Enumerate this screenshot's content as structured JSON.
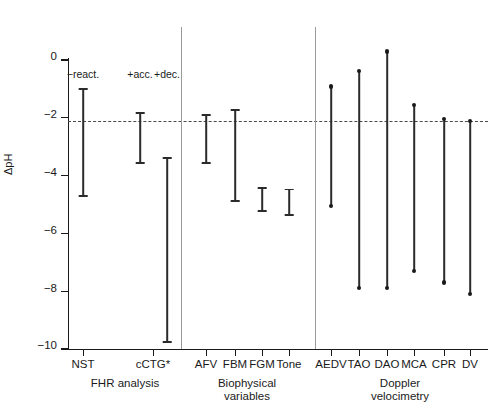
{
  "chart_data": {
    "type": "range",
    "title": "",
    "xlabel": "",
    "ylabel": "ΔpH",
    "ylim": [
      -10,
      0
    ],
    "yticks": [
      0,
      -2,
      -4,
      -6,
      -8,
      -10
    ],
    "ytick_labels": [
      "0",
      "−2",
      "−4",
      "−6",
      "−8",
      "−10"
    ],
    "grid": false,
    "reference_line": {
      "value": -2,
      "style": "dashed"
    },
    "legend": "none",
    "groups": [
      {
        "caption": "FHR analysis",
        "caption_lines": [
          "FHR analysis"
        ],
        "items": [
          {
            "label": "NST",
            "annotation": "−react.",
            "low": -4.75,
            "high": -0.98,
            "marker": "cap"
          },
          {
            "label": "cCTG*",
            "annotation": "+acc.",
            "low": -3.6,
            "high": -1.8,
            "marker": "cap"
          },
          {
            "label": "",
            "annotation": "+dec.",
            "low": -9.8,
            "high": -3.35,
            "marker": "cap"
          }
        ]
      },
      {
        "caption": "Biophysical variables",
        "caption_lines": [
          "Biophysical",
          "variables"
        ],
        "items": [
          {
            "label": "AFV",
            "annotation": "",
            "low": -3.6,
            "high": -1.88,
            "marker": "cap"
          },
          {
            "label": "FBM",
            "annotation": "",
            "low": -4.9,
            "high": -1.7,
            "marker": "cap"
          },
          {
            "label": "FGM",
            "annotation": "",
            "low": -5.25,
            "high": -4.4,
            "marker": "cap"
          },
          {
            "label": "Tone",
            "annotation": "",
            "low": -5.4,
            "high": -4.45,
            "marker": "cap"
          }
        ]
      },
      {
        "caption": "Doppler velocimetry",
        "caption_lines": [
          "Doppler",
          "velocimetry"
        ],
        "items": [
          {
            "label": "AEDV",
            "annotation": "",
            "low": -5.05,
            "high": -0.92,
            "marker": "dot"
          },
          {
            "label": "TAO",
            "annotation": "",
            "low": -7.9,
            "high": -0.38,
            "marker": "dot"
          },
          {
            "label": "DAO",
            "annotation": "",
            "low": -7.9,
            "high": 0.3,
            "marker": "dot"
          },
          {
            "label": "MCA",
            "annotation": "",
            "low": -7.3,
            "high": -1.55,
            "marker": "dot"
          },
          {
            "label": "CPR",
            "annotation": "",
            "low": -7.7,
            "high": -2.05,
            "marker": "dot"
          },
          {
            "label": "DV",
            "annotation": "",
            "low": -8.1,
            "high": -2.12,
            "marker": "dot"
          }
        ]
      }
    ]
  },
  "layout": {
    "x_positions": {
      "NST": 83,
      "cCTG_acc": 140,
      "cCTG_dec": 167,
      "AFV": 206,
      "FBM": 235,
      "FGM": 262,
      "Tone": 289,
      "AEDV": 331,
      "TAO": 359,
      "DAO": 387,
      "MCA": 414,
      "CPR": 444,
      "DV": 470
    },
    "tick_positions": [
      83,
      153,
      206,
      235,
      262,
      289,
      331,
      359,
      387,
      414,
      444,
      470
    ],
    "separators": [
      181,
      315
    ],
    "group_caption_x": [
      125,
      247,
      400
    ],
    "annotation_y": 68
  },
  "colors": {
    "axis": "#1a1a1a",
    "bar": "#2b2b2b",
    "reference": "#4a4a4a",
    "separator": "#9a9a9a",
    "background": "#ffffff"
  }
}
